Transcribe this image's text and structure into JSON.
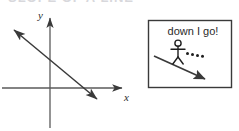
{
  "figure": {
    "title_cut_off": "SLOPE OF A LINE",
    "background_color": "#ffffff",
    "ink_color": "#3a3a3a",
    "text_color": "#2b2b2b"
  },
  "graph": {
    "axis_label_x": "x",
    "axis_label_y": "y",
    "x_axis": {
      "x1": 2,
      "y1": 88,
      "x2": 126,
      "y2": 88,
      "arrow_end": "right"
    },
    "y_axis": {
      "x1": 50,
      "y1": 128,
      "x2": 50,
      "y2": 14,
      "arrow_end": "top"
    },
    "line": {
      "x1": 10,
      "y1": 27,
      "x2": 101,
      "y2": 103,
      "arrow_start": true,
      "arrow_end": true,
      "slope_sign": "negative"
    }
  },
  "callout": {
    "text": "down I go!",
    "box": {
      "x": 148,
      "y": 20,
      "width": 84,
      "height": 68,
      "border_color": "#3a3a3a"
    },
    "arrow": {
      "x1": 154,
      "y1": 56,
      "x2": 208,
      "y2": 81,
      "arrow_end": "right-down"
    },
    "figure": {
      "head": {
        "cx": 178,
        "cy": 43,
        "r": 3.1
      },
      "body": {
        "x1": 178,
        "y1": 46,
        "x2": 178,
        "y2": 57
      },
      "arms": {
        "x1": 171,
        "y1": 49,
        "x2": 185,
        "y2": 49
      },
      "leg_left": {
        "x1": 178,
        "y1": 57,
        "x2": 173,
        "y2": 64
      },
      "leg_right": {
        "x1": 178,
        "y1": 57,
        "x2": 183,
        "y2": 64
      }
    },
    "motion_dots": [
      {
        "cx": 187,
        "cy": 54,
        "r": 1.5
      },
      {
        "cx": 192,
        "cy": 55,
        "r": 1.5
      },
      {
        "cx": 197,
        "cy": 56,
        "r": 1.5
      },
      {
        "cx": 202,
        "cy": 57,
        "r": 1.5
      }
    ]
  }
}
